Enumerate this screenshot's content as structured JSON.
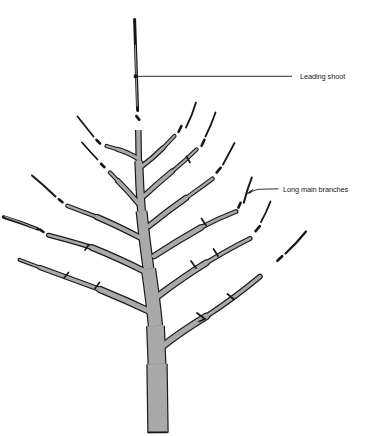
{
  "figure": {
    "background_color": "#ffffff",
    "ink_color": "#1a1a1a",
    "branch_fill_color": "#a9a9a9"
  },
  "annotations": {
    "leading_shoot": {
      "label": "Leading shoot"
    },
    "long_main_branches": {
      "label": "Long main branches"
    }
  }
}
